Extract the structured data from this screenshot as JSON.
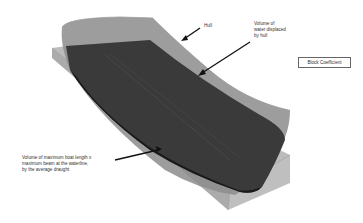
{
  "title_box": {
    "label": "Block Coefficient"
  },
  "labels": {
    "hull": "Hull",
    "water": [
      "Volume of",
      "water displaced",
      "by hull"
    ],
    "box": [
      "Volume of maximum boat length x",
      "maximum beam at the waterline,",
      "by the average draught"
    ]
  },
  "colors": {
    "box_fill": "#a8a8a8",
    "box_edge": "#8a8a8a",
    "hull_outer": "#8c8c8c",
    "hull_inner": "#3a3a3a",
    "hull_dark": "#1a1a1a",
    "arrow": "#111111",
    "background": "#ffffff"
  }
}
